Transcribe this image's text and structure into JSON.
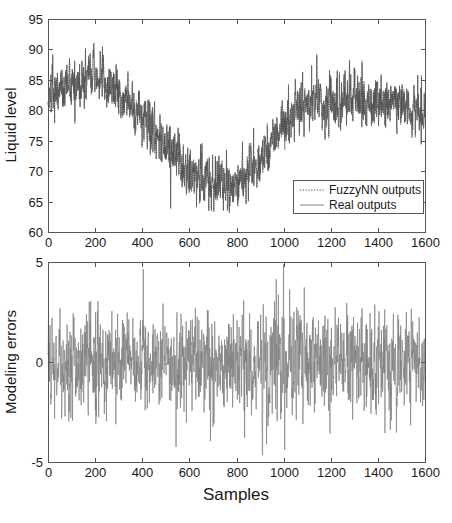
{
  "figure": {
    "background": "#ffffff",
    "trace_color_real": "#808080",
    "trace_color_pred": "#4d4d4d",
    "axis_color": "#555555"
  },
  "chart_data": [
    {
      "type": "line",
      "id": "liquid-level-plot",
      "title": "",
      "xlabel": "",
      "ylabel": "Liquid level",
      "xlim": [
        0,
        1600
      ],
      "ylim": [
        60,
        95
      ],
      "xticks": [
        0,
        200,
        400,
        600,
        800,
        1000,
        1200,
        1400,
        1600
      ],
      "yticks": [
        60,
        65,
        70,
        75,
        80,
        85,
        90,
        95
      ],
      "xticklabels": [
        "0",
        "200",
        "400",
        "600",
        "800",
        "1000",
        "1200",
        "1400",
        "1600"
      ],
      "yticklabels": [
        "60",
        "65",
        "70",
        "75",
        "80",
        "85",
        "90",
        "95"
      ],
      "grid": false,
      "legend_position": "lower right",
      "series": [
        {
          "name": "FuzzyNN outputs",
          "style": "dotted",
          "color": "#4d4d4d",
          "description": "Fuzzy neural network predicted liquid level, overlapping the real signal",
          "n_points": 1600
        },
        {
          "name": "Real outputs",
          "style": "solid",
          "color": "#808080",
          "description": "Measured liquid level, noisy signal with slow U-shaped trend",
          "n_points": 1600
        }
      ],
      "trend_anchors": {
        "x": [
          0,
          100,
          200,
          300,
          400,
          500,
          600,
          700,
          800,
          900,
          1000,
          1100,
          1200,
          1300,
          1400,
          1500,
          1600
        ],
        "y": [
          82.0,
          84.0,
          85.5,
          83.0,
          79.0,
          74.0,
          70.0,
          68.0,
          67.5,
          72.0,
          77.5,
          81.5,
          81.0,
          82.0,
          81.5,
          81.0,
          80.0
        ]
      },
      "noise_amplitude": 2.6,
      "observed_min": 64.5,
      "observed_max": 91.5
    },
    {
      "type": "line",
      "id": "modeling-errors-plot",
      "title": "",
      "xlabel": "Samples",
      "ylabel": "Modeling errors",
      "xlim": [
        0,
        1600
      ],
      "ylim": [
        -5,
        5
      ],
      "xticks": [
        0,
        200,
        400,
        600,
        800,
        1000,
        1200,
        1400,
        1600
      ],
      "yticks": [
        -5,
        0,
        5
      ],
      "xticklabels": [
        "0",
        "200",
        "400",
        "600",
        "800",
        "1000",
        "1200",
        "1400",
        "1600"
      ],
      "yticklabels": [
        "-5",
        "0",
        "5"
      ],
      "grid": false,
      "legend_position": "none",
      "series": [
        {
          "name": "Modeling errors",
          "style": "solid",
          "color": "#808080",
          "description": "Residual between real and FuzzyNN outputs, zero-mean noise band",
          "n_points": 1600
        }
      ],
      "noise_amplitude": 1.1,
      "observed_min": -4.4,
      "observed_max": 4.9,
      "annotations": [
        {
          "label": "large positive spike",
          "x": 1000,
          "y": 4.9
        },
        {
          "label": "large negative spike",
          "x": 1005,
          "y": -4.4
        }
      ]
    }
  ],
  "legend": {
    "entries": [
      {
        "label": "FuzzyNN outputs",
        "style": "dotted"
      },
      {
        "label": "Real outputs",
        "style": "solid"
      }
    ]
  },
  "labels": {
    "ylabel_top": "Liquid level",
    "ylabel_bottom": "Modeling errors",
    "xlabel_bottom": "Samples"
  }
}
